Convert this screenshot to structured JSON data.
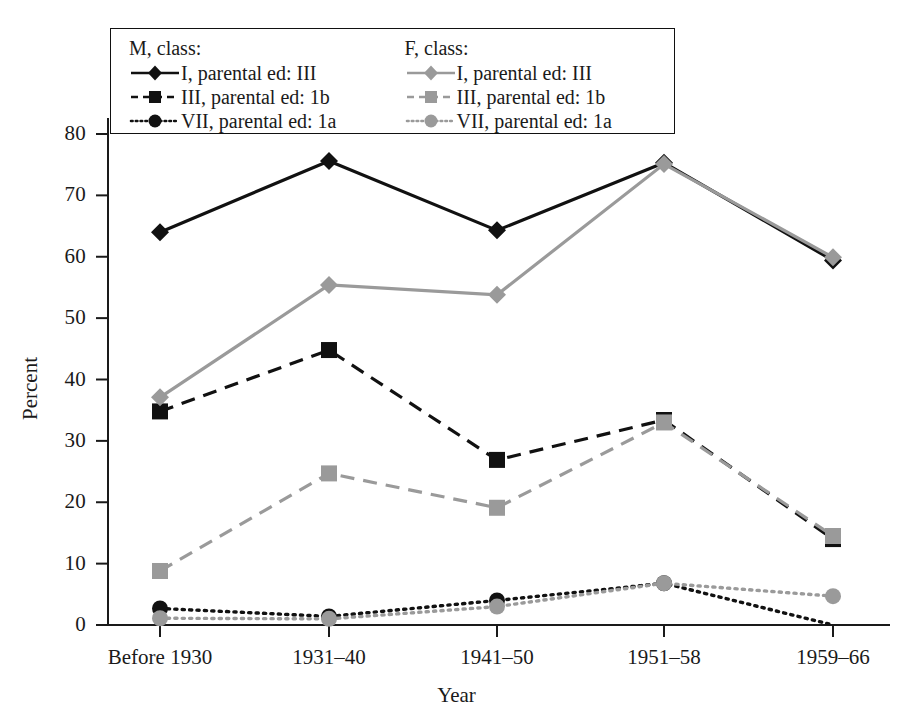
{
  "chart_data": {
    "type": "line",
    "title": "",
    "xlabel": "Year",
    "ylabel": "Percent",
    "categories": [
      "Before 1930",
      "1931–40",
      "1941–50",
      "1951–58",
      "1959–66"
    ],
    "ylim": [
      0,
      85
    ],
    "yticks": [
      0,
      10,
      20,
      30,
      40,
      50,
      60,
      70,
      80
    ],
    "grid": false,
    "legend_position": "top-left-inside",
    "legend_groups": [
      {
        "heading": "M, class:",
        "entries": [
          "I, parental ed: III",
          "III, parental ed: 1b",
          "VII, parental ed: 1a"
        ]
      },
      {
        "heading": "F, class:",
        "entries": [
          "I, parental ed: III",
          "III, parental ed: 1b",
          "VII, parental ed: 1a"
        ]
      }
    ],
    "series": [
      {
        "name": "M, class: I, parental ed: III",
        "group": "M",
        "marker": "diamond",
        "dash": "solid",
        "color": "#111111",
        "values": [
          64.0,
          75.6,
          64.3,
          75.3,
          59.4
        ]
      },
      {
        "name": "M, class: III, parental ed: 1b",
        "group": "M",
        "marker": "square",
        "dash": "dashed",
        "color": "#111111",
        "values": [
          34.8,
          44.8,
          26.9,
          33.4,
          14.0
        ]
      },
      {
        "name": "M, class: VII, parental ed: 1a",
        "group": "M",
        "marker": "circle",
        "dash": "dotted",
        "color": "#111111",
        "values": [
          2.7,
          1.4,
          4.0,
          6.8,
          0.0
        ]
      },
      {
        "name": "F, class: I, parental ed: III",
        "group": "F",
        "marker": "diamond",
        "dash": "solid",
        "color": "#9a9a9a",
        "values": [
          37.1,
          55.4,
          53.8,
          75.1,
          59.9
        ]
      },
      {
        "name": "F, class: III, parental ed: 1b",
        "group": "F",
        "marker": "square",
        "dash": "dashed",
        "color": "#9a9a9a",
        "values": [
          8.8,
          24.7,
          19.1,
          33.0,
          14.5
        ]
      },
      {
        "name": "F, class: VII, parental ed: 1a",
        "group": "F",
        "marker": "circle",
        "dash": "dotted",
        "color": "#9a9a9a",
        "values": [
          1.1,
          1.0,
          3.0,
          6.8,
          4.7
        ]
      }
    ]
  },
  "colors": {
    "male": "#111111",
    "female": "#9a9a9a",
    "axis": "#1a1a1a",
    "background": "#ffffff"
  }
}
